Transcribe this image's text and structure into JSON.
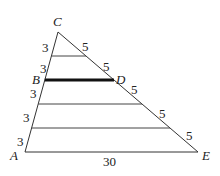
{
  "diagram": {
    "type": "triangle with parallel segments",
    "vertices": {
      "A": "A",
      "B": "B",
      "C": "C",
      "D": "D",
      "E": "E"
    },
    "left_side_segments": [
      "3",
      "3",
      "3",
      "3",
      "3"
    ],
    "right_side_segments": [
      "5",
      "5",
      "5",
      "5",
      "5"
    ],
    "base_label": "30",
    "highlighted_segment": "BD"
  }
}
